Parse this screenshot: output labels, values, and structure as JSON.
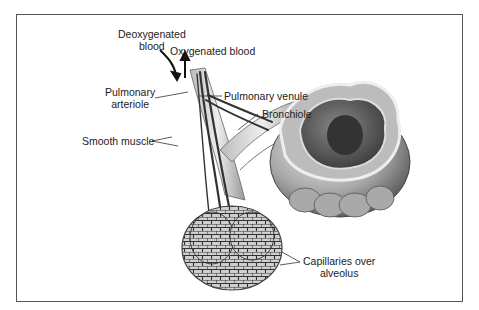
{
  "figure": {
    "labels": {
      "deoxygenated_blood_line1": "Deoxygenated",
      "deoxygenated_blood_line2": "blood",
      "oxygenated_blood": "Oxygenated blood",
      "pulmonary_arteriole_line1": "Pulmonary",
      "pulmonary_arteriole_line2": "arteriole",
      "pulmonary_venule": "Pulmonary venule",
      "bronchiole": "Bronchiole",
      "smooth_muscle": "Smooth muscle",
      "capillaries_line1": "Capillaries over",
      "capillaries_line2": "alveolus"
    },
    "colors": {
      "frame": "#555555",
      "ink": "#222222",
      "tissue_light": "#d9d9d9",
      "tissue_mid": "#9a9a9a",
      "tissue_dark": "#555555"
    }
  }
}
